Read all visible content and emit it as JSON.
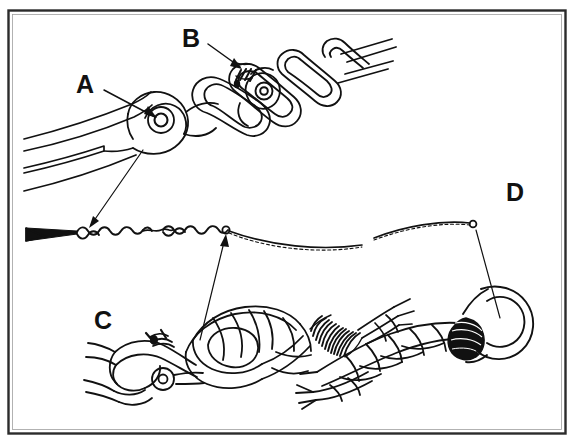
{
  "figure": {
    "kind": "technical-line-drawing",
    "title_visible": false,
    "background_color": "#ffffff",
    "ink_color": "#111111",
    "border": {
      "outer_color": "#2b2b2b",
      "inner_color": "#2b2b2b",
      "x": 8,
      "y": 10,
      "width": 558,
      "height": 424
    },
    "callouts": [
      {
        "id": "A",
        "label": "A",
        "x": 76,
        "y": 72,
        "points_to": "shackle-pin-eye",
        "leader": {
          "from_x": 104,
          "from_y": 90,
          "to_x": 158,
          "to_y": 112
        }
      },
      {
        "id": "B",
        "label": "B",
        "x": 182,
        "y": 26,
        "points_to": "seizing-wire-on-connecting-link",
        "leader": {
          "from_x": 208,
          "from_y": 44,
          "to_x": 243,
          "to_y": 58
        }
      },
      {
        "id": "C",
        "label": "C",
        "x": 94,
        "y": 308,
        "points_to": "eye-splice-with-whipping",
        "leader": {
          "from_x": 0,
          "from_y": 0,
          "to_x": 0,
          "to_y": 0
        }
      },
      {
        "id": "D",
        "label": "D",
        "x": 506,
        "y": 180,
        "points_to": "rope-seizing-band-at-ring",
        "leader": {
          "from_x": 0,
          "from_y": 0,
          "to_x": 0,
          "to_y": 0
        }
      }
    ],
    "subjects": [
      {
        "name": "anchor-shank-fork",
        "description": "forked shank end at left"
      },
      {
        "name": "shackle",
        "description": "shackle connecting shank to chain"
      },
      {
        "name": "anchor-chain",
        "description": "chain links receding to upper right"
      },
      {
        "name": "connecting-link",
        "description": "detachable link with lashed pin"
      },
      {
        "name": "seizing-wire",
        "description": "thin twisted wire running across figure"
      },
      {
        "name": "wire-hook-end",
        "description": "pointed hook end of seizing wire at left"
      },
      {
        "name": "rope-eye-splice",
        "description": "spliced rope eye around a shackle"
      },
      {
        "name": "rope-whipping",
        "description": "coiled whipping around splice tail"
      },
      {
        "name": "rope-seizing",
        "description": "heavy black seizing band on right rope"
      },
      {
        "name": "ring",
        "description": "ring or thimble at right edge"
      }
    ]
  }
}
